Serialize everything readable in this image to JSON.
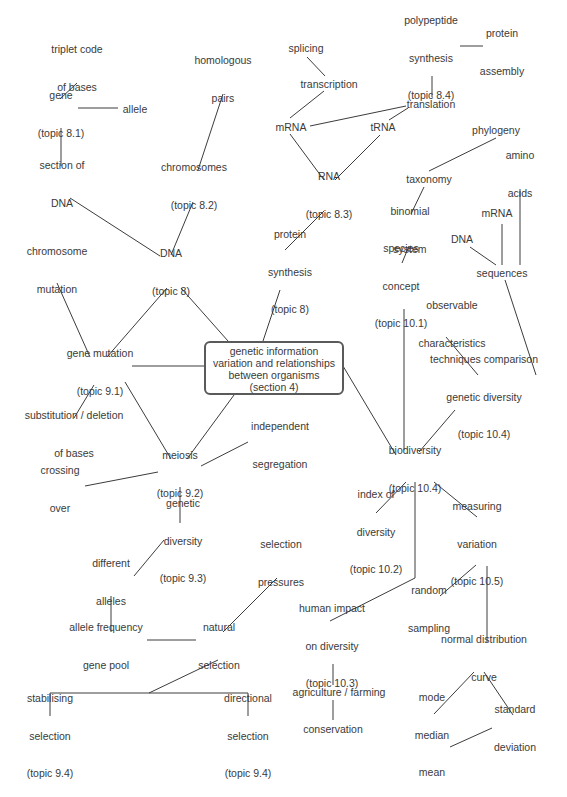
{
  "title": "genetic information variation and relationships between organisms (section 4)",
  "central": {
    "lines": [
      "genetic information",
      "variation and relationships",
      "between organisms",
      "(section 4)"
    ]
  },
  "nodes": {
    "triplet_code": [
      "triplet code",
      "of bases"
    ],
    "homologous_pairs": [
      "homologous",
      "pairs"
    ],
    "gene": [
      "gene",
      "(topic 8.1)"
    ],
    "allele": [
      "allele"
    ],
    "section_of_dna": [
      "section of",
      "DNA"
    ],
    "chromosomes": [
      "chromosomes",
      "(topic 8.2)"
    ],
    "splicing": [
      "splicing"
    ],
    "transcription": [
      "transcription"
    ],
    "polypeptide_synthesis": [
      "polypeptide",
      "synthesis",
      "(topic 8.4)"
    ],
    "protein_assembly": [
      "protein",
      "assembly"
    ],
    "translation": [
      "translation"
    ],
    "mrna_top": [
      "mRNA"
    ],
    "trna": [
      "tRNA"
    ],
    "phylogeny": [
      "phylogeny"
    ],
    "taxonomy": [
      "taxonomy"
    ],
    "amino_acids": [
      "amino",
      "acids"
    ],
    "rna": [
      "RNA",
      "(topic 8.3)"
    ],
    "binomial_system": [
      "binomial",
      "system"
    ],
    "mrna_right": [
      "mRNA"
    ],
    "dna_right": [
      "DNA"
    ],
    "sequences": [
      "sequences"
    ],
    "chromosome_mutation": [
      "chromosome",
      "mutation"
    ],
    "dna_topic8": [
      "DNA",
      "(topic 8)"
    ],
    "protein_synthesis": [
      "protein",
      "synthesis",
      "(topic 8)"
    ],
    "species_concept": [
      "species",
      "concept",
      "(topic 10.1)"
    ],
    "observable_characteristics": [
      "observable",
      "characteristics"
    ],
    "gene_mutation": [
      "gene mutation",
      "(topic 9.1)"
    ],
    "techniques_comparison": [
      "techniques comparison",
      "genetic diversity",
      "(topic 10.4)"
    ],
    "substitution_deletion": [
      "substitution / deletion",
      "of bases"
    ],
    "independent_segregation": [
      "independent",
      "segregation"
    ],
    "meiosis": [
      "meiosis",
      "(topic 9.2)"
    ],
    "crossing_over": [
      "crossing",
      "over"
    ],
    "biodiversity": [
      "biodiversity",
      "(topic 10.4)"
    ],
    "index_of_diversity": [
      "index of",
      "diversity",
      "(topic 10.2)"
    ],
    "measuring_variation": [
      "measuring",
      "variation",
      "(topic 10.5)"
    ],
    "genetic_diversity": [
      "genetic",
      "diversity",
      "(topic 9.3)"
    ],
    "selection_pressures": [
      "selection",
      "pressures"
    ],
    "different_alleles": [
      "different",
      "alleles"
    ],
    "random_sampling": [
      "random",
      "sampling"
    ],
    "allele_frequency": [
      "allele frequency",
      "gene pool"
    ],
    "natural_selection": [
      "natural",
      "selection"
    ],
    "human_impact": [
      "human impact",
      "on diversity",
      "(topic 10.3)"
    ],
    "normal_distribution": [
      "normal distribution",
      "curve"
    ],
    "agriculture_farming": [
      "agriculture / farming"
    ],
    "stabilising_selection": [
      "stabilising",
      "selection",
      "(topic 9.4)"
    ],
    "directional_selection": [
      "directional",
      "selection",
      "(topic 9.4)"
    ],
    "conservation": [
      "conservation"
    ],
    "mode_median_mean": [
      "mode",
      "median",
      "mean"
    ],
    "standard_deviation": [
      "standard",
      "deviation"
    ]
  },
  "colors": {
    "text": "#3a3a3a",
    "line": "#3c3c3c",
    "box_border": "#5a5a5a",
    "background": "#ffffff"
  }
}
